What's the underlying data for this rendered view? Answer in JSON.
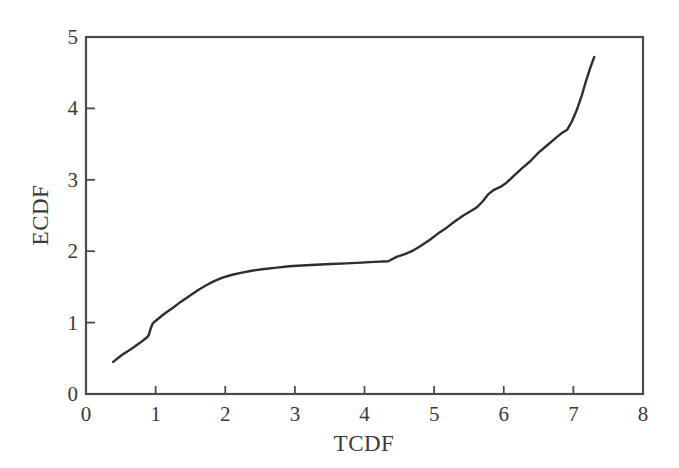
{
  "chart_data": {
    "type": "line",
    "title": "",
    "subtitle": "",
    "xlabel": "TCDF",
    "ylabel": "ECDF",
    "xlim": [
      0,
      8
    ],
    "ylim": [
      0,
      5
    ],
    "xticks": [
      "0",
      "1",
      "2",
      "3",
      "4",
      "5",
      "6",
      "7",
      "8"
    ],
    "yticks": [
      "0",
      "1",
      "2",
      "3",
      "4",
      "5"
    ],
    "grid": false,
    "legend": null,
    "annotations": [],
    "line_color": "#2e2e2e",
    "line_width": 2.4,
    "series": [
      {
        "name": "ECDF vs TCDF",
        "points": [
          [
            0.39,
            0.45
          ],
          [
            0.52,
            0.55
          ],
          [
            0.65,
            0.63
          ],
          [
            0.78,
            0.72
          ],
          [
            0.86,
            0.78
          ],
          [
            0.9,
            0.82
          ],
          [
            0.93,
            0.92
          ],
          [
            0.96,
            0.99
          ],
          [
            1.02,
            1.04
          ],
          [
            1.12,
            1.12
          ],
          [
            1.24,
            1.2
          ],
          [
            1.36,
            1.29
          ],
          [
            1.48,
            1.37
          ],
          [
            1.6,
            1.45
          ],
          [
            1.72,
            1.52
          ],
          [
            1.84,
            1.58
          ],
          [
            1.96,
            1.63
          ],
          [
            2.1,
            1.67
          ],
          [
            2.24,
            1.7
          ],
          [
            2.4,
            1.73
          ],
          [
            2.56,
            1.75
          ],
          [
            2.74,
            1.77
          ],
          [
            2.92,
            1.79
          ],
          [
            3.1,
            1.8
          ],
          [
            3.3,
            1.81
          ],
          [
            3.52,
            1.82
          ],
          [
            3.74,
            1.83
          ],
          [
            3.96,
            1.84
          ],
          [
            4.14,
            1.85
          ],
          [
            4.34,
            1.86
          ],
          [
            4.46,
            1.92
          ],
          [
            4.58,
            1.96
          ],
          [
            4.68,
            2.0
          ],
          [
            4.8,
            2.07
          ],
          [
            4.94,
            2.16
          ],
          [
            5.06,
            2.25
          ],
          [
            5.18,
            2.33
          ],
          [
            5.3,
            2.42
          ],
          [
            5.42,
            2.5
          ],
          [
            5.54,
            2.57
          ],
          [
            5.62,
            2.62
          ],
          [
            5.7,
            2.7
          ],
          [
            5.78,
            2.8
          ],
          [
            5.86,
            2.86
          ],
          [
            5.95,
            2.9
          ],
          [
            6.04,
            2.96
          ],
          [
            6.14,
            3.05
          ],
          [
            6.26,
            3.16
          ],
          [
            6.38,
            3.26
          ],
          [
            6.5,
            3.38
          ],
          [
            6.62,
            3.48
          ],
          [
            6.74,
            3.58
          ],
          [
            6.84,
            3.66
          ],
          [
            6.91,
            3.7
          ],
          [
            6.98,
            3.82
          ],
          [
            7.05,
            3.98
          ],
          [
            7.12,
            4.18
          ],
          [
            7.18,
            4.38
          ],
          [
            7.24,
            4.56
          ],
          [
            7.3,
            4.72
          ]
        ]
      }
    ]
  },
  "axes": {
    "x_title": "TCDF",
    "y_title": "ECDF",
    "x_tick_labels": [
      "0",
      "1",
      "2",
      "3",
      "4",
      "5",
      "6",
      "7",
      "8"
    ],
    "y_tick_labels": [
      "0",
      "1",
      "2",
      "3",
      "4",
      "5"
    ],
    "frame_color": "#4a4a4a"
  }
}
